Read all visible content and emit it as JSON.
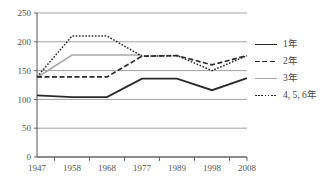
{
  "chart_data": {
    "type": "line",
    "title": "",
    "xlabel": "",
    "ylabel": "",
    "x": [
      "1947",
      "1958",
      "1968",
      "1977",
      "1989",
      "1998",
      "2008"
    ],
    "ylim": [
      0,
      250
    ],
    "yticks": [
      "0",
      "50",
      "100",
      "150",
      "200",
      "250"
    ],
    "grid": true,
    "legend_position": "right",
    "series": [
      {
        "name": "1年",
        "style": "solid-dark",
        "color": "#2b2b2b",
        "values": [
          107,
          104,
          104,
          136,
          136,
          116,
          137
        ]
      },
      {
        "name": "2年",
        "style": "dashed",
        "color": "#2b2b2b",
        "values": [
          139,
          139,
          139,
          175,
          176,
          160,
          176
        ]
      },
      {
        "name": "3年",
        "style": "solid-gray",
        "color": "#a8a8a8",
        "values": [
          138,
          177,
          177,
          177,
          null,
          null,
          null
        ]
      },
      {
        "name": "4, 5, 6年",
        "style": "dotted",
        "color": "#2b2b2b",
        "values": [
          139,
          210,
          210,
          175,
          176,
          150,
          176
        ]
      }
    ]
  },
  "legend": {
    "items": [
      {
        "label": "1年"
      },
      {
        "label": "2年"
      },
      {
        "label": "3年"
      },
      {
        "label": "4, 5, 6年"
      }
    ]
  }
}
